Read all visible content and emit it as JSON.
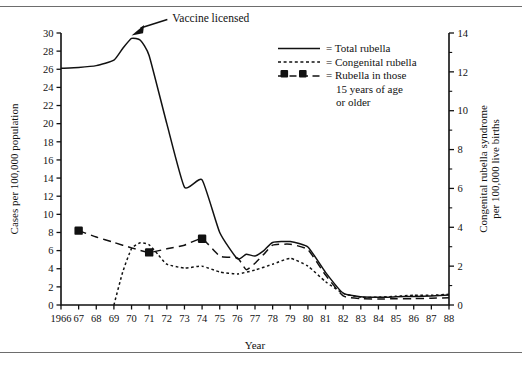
{
  "figure": {
    "annotation": "Vaccine licensed",
    "xlabel": "Year",
    "ylabel_left": "Cases per 100,000 population",
    "ylabel_right_line1": "Congenital rubella syndrome",
    "ylabel_right_line2": "per 100,000 live births"
  },
  "legend": {
    "items": [
      {
        "key": "total",
        "symbol": "solid-line",
        "label": "= Total rubella"
      },
      {
        "key": "congenital",
        "symbol": "dotted-line",
        "label": "= Congenital rubella"
      },
      {
        "key": "older15",
        "symbol": "dashed-square-line",
        "label": "= Rubella in those"
      },
      {
        "key": "older15_cont1",
        "symbol": "none",
        "label": "15 years of age"
      },
      {
        "key": "older15_cont2",
        "symbol": "none",
        "label": "or older"
      }
    ]
  },
  "chart_data": {
    "type": "line",
    "title": "",
    "xlabel": "Year",
    "ylabel": "Cases per 100,000 population",
    "ylabel_secondary": "Congenital rubella syndrome per 100,000 live births",
    "grid": false,
    "legend_position": "top-center",
    "xlim": [
      1966,
      1988
    ],
    "ylim": [
      0,
      30
    ],
    "ylim_secondary": [
      0,
      14
    ],
    "xticks": [
      1966,
      1967,
      1968,
      1969,
      1970,
      1971,
      1972,
      1973,
      1974,
      1975,
      1976,
      1977,
      1978,
      1979,
      1980,
      1981,
      1982,
      1983,
      1984,
      1985,
      1986,
      1987,
      1988
    ],
    "xticklabels": [
      "1966",
      "67",
      "68",
      "69",
      "70",
      "71",
      "72",
      "73",
      "74",
      "75",
      "76",
      "77",
      "78",
      "79",
      "80",
      "81",
      "82",
      "83",
      "84",
      "85",
      "86",
      "87",
      "88"
    ],
    "yticks": [
      0,
      2,
      4,
      6,
      8,
      10,
      12,
      14,
      16,
      18,
      20,
      22,
      24,
      26,
      28,
      30
    ],
    "yticks_secondary": [
      0,
      2,
      4,
      6,
      8,
      10,
      12,
      14
    ],
    "yminor_secondary": [
      1,
      3,
      5,
      7,
      9,
      11,
      13
    ],
    "annotations": [
      {
        "text": "Vaccine licensed",
        "x": 1970,
        "y": 29.4,
        "label_x": 1972.2,
        "label_y": 31.6
      }
    ],
    "series": [
      {
        "name": "Total rubella",
        "axis": "left",
        "style": "solid",
        "x": [
          1966,
          1967,
          1968,
          1969,
          1969.5,
          1970,
          1970.5,
          1971,
          1972,
          1973,
          1974,
          1975,
          1976,
          1976.5,
          1977,
          1977.5,
          1978,
          1979,
          1980,
          1981,
          1982,
          1983,
          1984,
          1985,
          1986,
          1987,
          1988
        ],
        "y": [
          26.1,
          26.2,
          26.4,
          27.0,
          28.3,
          29.4,
          29.2,
          27.5,
          20.0,
          13.0,
          13.8,
          8.0,
          5.1,
          5.6,
          5.4,
          6.0,
          6.9,
          7.0,
          6.4,
          3.6,
          1.3,
          0.9,
          0.85,
          0.9,
          0.95,
          1.0,
          1.1
        ]
      },
      {
        "name": "Congenital rubella",
        "axis": "right",
        "style": "dotted",
        "x": [
          1969,
          1969.5,
          1970,
          1970.5,
          1971,
          1971.5,
          1972,
          1973,
          1974,
          1975,
          1976,
          1977,
          1978,
          1979,
          1980,
          1981,
          1982,
          1983,
          1984,
          1985,
          1986,
          1987,
          1988
        ],
        "y": [
          0.0,
          1.7,
          2.9,
          3.2,
          3.1,
          2.6,
          2.1,
          1.9,
          2.0,
          1.7,
          1.6,
          1.8,
          2.1,
          2.4,
          2.0,
          1.2,
          0.6,
          0.4,
          0.4,
          0.45,
          0.5,
          0.5,
          0.55
        ]
      },
      {
        "name": "Rubella in those 15 years of age or older",
        "axis": "left",
        "style": "dashed-with-squares",
        "x": [
          1967,
          1968,
          1969,
          1970,
          1971,
          1972,
          1973,
          1974,
          1975,
          1976,
          1976.5,
          1977,
          1977.5,
          1978,
          1979,
          1980,
          1981,
          1982,
          1983,
          1984,
          1985,
          1986,
          1987,
          1988
        ],
        "y": [
          8.2,
          7.5,
          6.9,
          6.3,
          5.8,
          6.2,
          6.6,
          7.3,
          5.4,
          5.2,
          3.9,
          4.6,
          5.6,
          6.6,
          6.7,
          6.1,
          3.3,
          1.0,
          0.7,
          0.65,
          0.7,
          0.7,
          0.75,
          0.8
        ],
        "markers": [
          {
            "x": 1967,
            "y": 8.2
          },
          {
            "x": 1971,
            "y": 5.8
          },
          {
            "x": 1974,
            "y": 7.3
          }
        ]
      }
    ]
  }
}
